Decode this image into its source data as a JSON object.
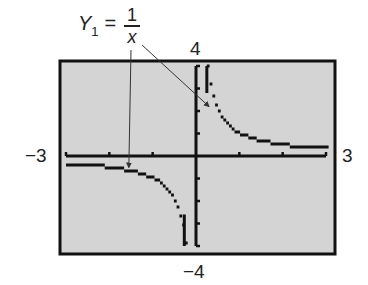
{
  "figure": {
    "equation": {
      "lhs": "Y",
      "subscript": "1",
      "equals": "=",
      "numerator": "1",
      "denominator": "x"
    },
    "window_labels": {
      "xmin": "−3",
      "xmax": "3",
      "ymin": "−4",
      "ymax": "4"
    },
    "colors": {
      "screen_fill": "#d4d4d4",
      "border": "#111111",
      "curve": "#111111",
      "arrow": "#333333"
    }
  },
  "chart_data": {
    "type": "line",
    "function": "1/x",
    "xlabel": "",
    "ylabel": "",
    "xlim": [
      -3,
      3
    ],
    "ylim": [
      -4,
      4
    ],
    "x_ticks": [
      -3,
      -2,
      -1,
      0,
      1,
      2,
      3
    ],
    "y_ticks": [
      -4,
      -3,
      -2,
      -1,
      0,
      1,
      2,
      3,
      4
    ],
    "grid": false,
    "series": [
      {
        "name": "Y1 (x<0)",
        "x": [
          -3,
          -2.5,
          -2,
          -1.5,
          -1,
          -0.75,
          -0.5,
          -0.4,
          -0.3,
          -0.25
        ],
        "y": [
          -0.33,
          -0.4,
          -0.5,
          -0.67,
          -1,
          -1.33,
          -2,
          -2.5,
          -3.33,
          -4
        ]
      },
      {
        "name": "Y1 (x>0)",
        "x": [
          0.25,
          0.3,
          0.4,
          0.5,
          0.75,
          1,
          1.5,
          2,
          2.5,
          3
        ],
        "y": [
          4,
          3.33,
          2.5,
          2,
          1.33,
          1,
          0.67,
          0.5,
          0.4,
          0.33
        ]
      }
    ],
    "annotations": [
      {
        "text": "Y1 = 1/x",
        "arrows_to": [
          [
            -1.55,
            -0.6
          ],
          [
            0.3,
            2.2
          ]
        ]
      }
    ]
  }
}
